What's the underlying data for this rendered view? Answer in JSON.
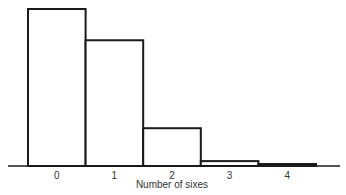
{
  "chart_data": {
    "type": "bar",
    "title": "",
    "xlabel": "Number of sixes",
    "ylabel": "",
    "categories": [
      "0",
      "1",
      "2",
      "3",
      "4"
    ],
    "values": [
      0.482,
      0.386,
      0.116,
      0.015,
      0.001
    ],
    "ylim": [
      0,
      0.5
    ],
    "grid": false,
    "legend": null,
    "bar_style": "histogram (adjacent, outlined, no fill)"
  }
}
